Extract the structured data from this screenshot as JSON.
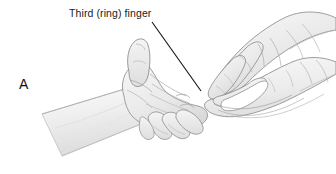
{
  "figure": {
    "panel_letter": "A",
    "background_color": "#ffffff",
    "width": 336,
    "height": 174
  },
  "annotations": [
    {
      "id": "third-ring-finger",
      "label": "Third (ring) finger",
      "text_color": "#1a1a1a",
      "leader_line": {
        "color": "#111111",
        "from_x": 152,
        "from_y": 22,
        "to_x": 201,
        "to_y": 91
      }
    }
  ],
  "illustration": {
    "type": "medical-line-drawing",
    "subject": "examiner's two hands palpating a patient's hand at the third (ring) finger",
    "fill_light": "#f4f4f4",
    "fill_mid": "#e6e6e6",
    "fill_shadow": "#d2d2d2",
    "line_color": "#8e8e8e",
    "line_color_dark": "#6f6f6f",
    "parts": [
      {
        "name": "patient-forearm",
        "description": "tapering light gray forearm entering from lower left"
      },
      {
        "name": "patient-hand",
        "description": "patient's hand with thumb extended upward, palm toward viewer"
      },
      {
        "name": "examiner-upper-hand",
        "description": "examiner's hand entering from upper right, fingers pointing down-left"
      },
      {
        "name": "examiner-lower-hand",
        "description": "examiner's second hand entering from right, pinching the ring finger"
      }
    ]
  }
}
